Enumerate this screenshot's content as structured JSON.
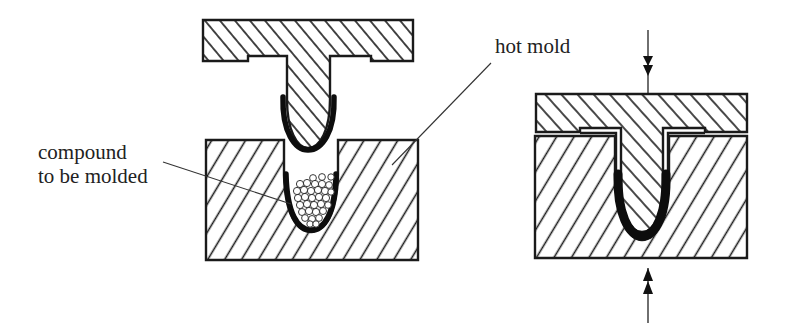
{
  "labels": {
    "hot_mold": "hot mold",
    "compound_line1": "compound",
    "compound_line2": "to be molded"
  },
  "panels": [
    {
      "id": "left",
      "state": "mold open, compound placed in lower cavity"
    },
    {
      "id": "right",
      "state": "mold closed, pressure applied from top and bottom"
    }
  ],
  "arrows": {
    "top": {
      "direction": "down",
      "heads": 2
    },
    "bottom": {
      "direction": "up",
      "heads": 2
    }
  },
  "colors": {
    "line": "#1a1a1a",
    "background": "#ffffff",
    "compound_coating": "#0d0d0d"
  }
}
